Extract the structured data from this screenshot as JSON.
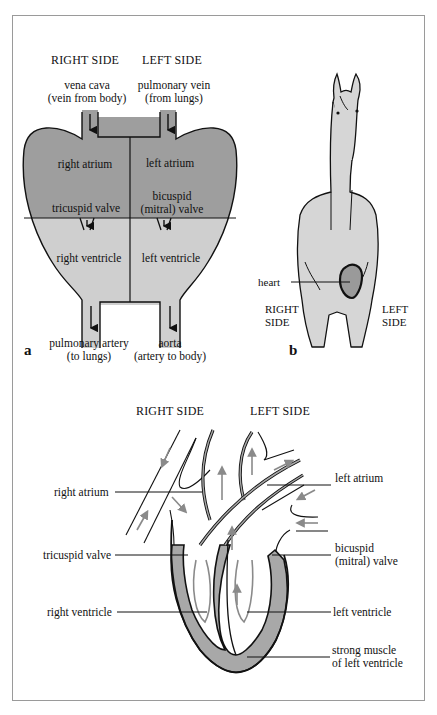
{
  "colors": {
    "atrium_fill": "#9e9e9e",
    "ventricle_fill": "#cfcfcf",
    "horse_fill": "#d6d6d6",
    "heart_fill": "#9a9a9a",
    "muscle_fill": "#a8a8a8",
    "flow_arrow": "#8a8a8a",
    "outline": "#111111",
    "frame": "#9a9a9a"
  },
  "panel_a": {
    "label": "a",
    "header_right": "RIGHT SIDE",
    "header_left": "LEFT SIDE",
    "inflow_right_line1": "vena cava",
    "inflow_right_line2": "(vein from body)",
    "inflow_left_line1": "pulmonary vein",
    "inflow_left_line2": "(from lungs)",
    "right_atrium": "right atrium",
    "left_atrium": "left atrium",
    "tricuspid_valve": "tricuspid valve",
    "bicuspid_line1": "bicuspid",
    "bicuspid_line2": "(mitral) valve",
    "right_ventricle": "right ventricle",
    "left_ventricle": "left ventricle",
    "outflow_right_line1": "pulmonary artery",
    "outflow_right_line2": "(to lungs)",
    "outflow_left_line1": "aorta",
    "outflow_left_line2": "(artery to body)"
  },
  "panel_b": {
    "label": "b",
    "heart": "heart",
    "right_side_line1": "RIGHT",
    "right_side_line2": "SIDE",
    "left_side_line1": "LEFT",
    "left_side_line2": "SIDE"
  },
  "panel_c": {
    "header_right": "RIGHT SIDE",
    "header_left": "LEFT SIDE",
    "right_atrium": "right atrium",
    "left_atrium": "left atrium",
    "tricuspid_valve": "tricuspid valve",
    "bicuspid_line1": "bicuspid",
    "bicuspid_line2": "(mitral) valve",
    "right_ventricle": "right ventricle",
    "left_ventricle": "left ventricle",
    "muscle_line1": "strong muscle",
    "muscle_line2": "of left ventricle"
  }
}
